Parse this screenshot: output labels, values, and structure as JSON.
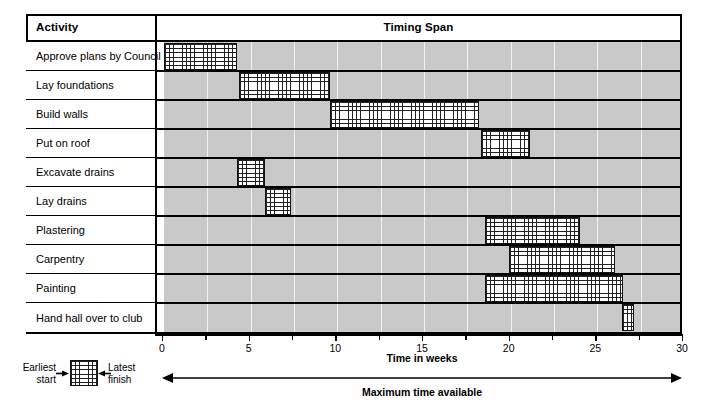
{
  "table": {
    "header_activity": "Activity",
    "header_span": "Timing Span"
  },
  "axis": {
    "title": "Time in weeks",
    "ticks": [
      "0",
      "5",
      "10",
      "15",
      "20",
      "25",
      "30"
    ],
    "min": 0,
    "max": 30
  },
  "legend": {
    "earliest_line1": "Earliest",
    "earliest_line2": "start",
    "latest_line1": "Latest",
    "latest_line2": "finish"
  },
  "maximum_time": {
    "label": "Maximum time available"
  },
  "colors": {
    "band": "#c9c9c9",
    "bar_outline": "#111111",
    "bar_hatch": "#222222",
    "rule": "#000000"
  },
  "chart_data": {
    "type": "bar",
    "title": "Timing Span",
    "xlabel": "Time in weeks",
    "ylabel": "Activity",
    "xlim": [
      0,
      30
    ],
    "grid": true,
    "legend_position": "bottom-left",
    "categories": [
      "Approve plans by Council",
      "Lay foundations",
      "Build walls",
      "Put on roof",
      "Excavate drains",
      "Lay drains",
      "Plastering",
      "Carpentry",
      "Painting",
      "Hand hall over to club"
    ],
    "tasks": [
      {
        "activity": "Approve plans by Council",
        "earliest_start": 0.0,
        "latest_finish": 4.2
      },
      {
        "activity": "Lay foundations",
        "earliest_start": 4.3,
        "latest_finish": 9.6
      },
      {
        "activity": "Build walls",
        "earliest_start": 9.6,
        "latest_finish": 18.2
      },
      {
        "activity": "Put on roof",
        "earliest_start": 18.3,
        "latest_finish": 21.1
      },
      {
        "activity": "Excavate drains",
        "earliest_start": 4.2,
        "latest_finish": 5.8
      },
      {
        "activity": "Lay drains",
        "earliest_start": 5.8,
        "latest_finish": 7.3
      },
      {
        "activity": "Plastering",
        "earliest_start": 18.5,
        "latest_finish": 24.0
      },
      {
        "activity": "Carpentry",
        "earliest_start": 19.9,
        "latest_finish": 26.0
      },
      {
        "activity": "Painting",
        "earliest_start": 18.5,
        "latest_finish": 26.5
      },
      {
        "activity": "Hand hall over to club",
        "earliest_start": 26.4,
        "latest_finish": 27.1
      }
    ]
  }
}
